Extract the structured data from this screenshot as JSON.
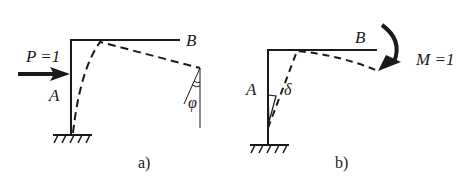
{
  "figure_a": {
    "caption": "a)",
    "load_label": "P =1",
    "point_a": "A",
    "point_b": "B",
    "angle_label": "φ"
  },
  "figure_b": {
    "caption": "b)",
    "moment_label": "M =1",
    "point_a": "A",
    "point_b": "B",
    "deflection_label": "δ"
  },
  "colors": {
    "stroke": "#1a1a1a",
    "background": "#ffffff"
  }
}
